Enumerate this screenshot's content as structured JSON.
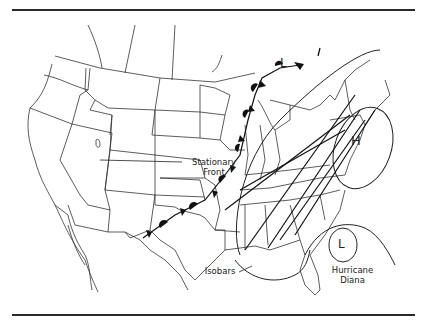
{
  "map": {
    "title": "Weather map of the United States",
    "labels": {
      "stationary_front_line1": "Stationary",
      "stationary_front_line2": "Front",
      "isobars": "Isobars",
      "hurricane_line1": "Hurricane",
      "hurricane_line2": "Diana"
    },
    "symbols": {
      "high_pressure": "H",
      "low_pressure_north": "L",
      "low_pressure_hurricane": "L"
    },
    "colors": {
      "line": "#222222",
      "background": "#ffffff"
    }
  }
}
